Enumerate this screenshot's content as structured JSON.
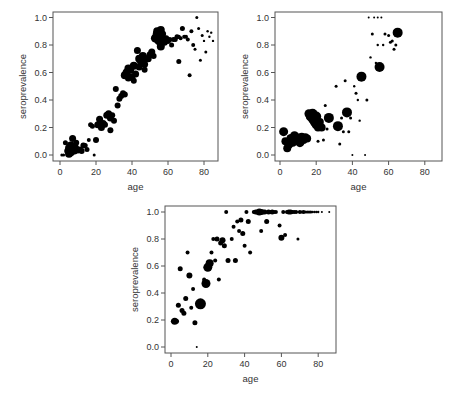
{
  "chart_data": [
    {
      "id": "chart1",
      "type": "scatter",
      "title": "",
      "xlabel": "age",
      "ylabel": "seroprevalence",
      "xlim": [
        -5,
        88
      ],
      "ylim": [
        -0.04,
        1.04
      ],
      "xticks": [
        0,
        20,
        40,
        60,
        80
      ],
      "yticks": [
        0.0,
        0.2,
        0.4,
        0.6,
        0.8,
        1.0
      ],
      "ytick_labels": [
        "0.0",
        "0.2",
        "0.4",
        "0.6",
        "0.8",
        "1.0"
      ],
      "grid": false,
      "legend": null,
      "frame": {
        "left": 53,
        "top": 12,
        "right": 218,
        "bottom": 161
      },
      "map": {
        "x0": 60,
        "xs": 1.8,
        "y0": 155,
        "ys": 137.5
      },
      "points": [
        [
          1,
          0.0,
          1.5
        ],
        [
          2,
          0.0,
          1.5
        ],
        [
          3,
          0.09,
          2.5
        ],
        [
          4,
          0.03,
          3
        ],
        [
          5,
          0.01,
          4
        ],
        [
          5,
          0.05,
          4
        ],
        [
          6,
          0.02,
          4
        ],
        [
          6,
          0.07,
          4
        ],
        [
          7,
          0.04,
          4
        ],
        [
          7,
          0.12,
          3.5
        ],
        [
          8,
          0.06,
          4
        ],
        [
          8,
          0.03,
          3.5
        ],
        [
          9,
          0.05,
          3
        ],
        [
          9,
          0.09,
          3
        ],
        [
          10,
          0.03,
          2.5
        ],
        [
          11,
          0.04,
          3
        ],
        [
          12,
          0.03,
          3
        ],
        [
          13,
          0.07,
          3
        ],
        [
          14,
          0.07,
          2.5
        ],
        [
          15,
          0.04,
          2.5
        ],
        [
          16,
          0.11,
          2
        ],
        [
          17,
          0.22,
          2.5
        ],
        [
          18,
          0.21,
          2.5
        ],
        [
          19,
          0.0,
          1.5
        ],
        [
          20,
          0.11,
          3
        ],
        [
          21,
          0.22,
          3.5
        ],
        [
          22,
          0.26,
          3.5
        ],
        [
          23,
          0.2,
          3.5
        ],
        [
          24,
          0.23,
          3.5
        ],
        [
          25,
          0.22,
          3
        ],
        [
          26,
          0.29,
          3.5
        ],
        [
          27,
          0.3,
          3.5
        ],
        [
          28,
          0.27,
          3.5
        ],
        [
          28,
          0.18,
          3
        ],
        [
          29,
          0.29,
          3
        ],
        [
          30,
          0.25,
          3
        ],
        [
          31,
          0.48,
          3
        ],
        [
          32,
          0.36,
          3
        ],
        [
          33,
          0.41,
          3
        ],
        [
          34,
          0.43,
          3
        ],
        [
          35,
          0.45,
          3
        ],
        [
          36,
          0.44,
          3
        ],
        [
          36,
          0.58,
          4
        ],
        [
          37,
          0.6,
          4
        ],
        [
          38,
          0.63,
          4
        ],
        [
          38,
          0.56,
          3.5
        ],
        [
          39,
          0.62,
          4
        ],
        [
          40,
          0.57,
          3.5
        ],
        [
          41,
          0.65,
          4
        ],
        [
          41,
          0.54,
          3
        ],
        [
          42,
          0.59,
          3.5
        ],
        [
          43,
          0.76,
          3.5
        ],
        [
          44,
          0.7,
          4
        ],
        [
          44,
          0.64,
          3.5
        ],
        [
          45,
          0.68,
          4
        ],
        [
          46,
          0.72,
          4
        ],
        [
          47,
          0.62,
          3
        ],
        [
          47,
          0.66,
          3.5
        ],
        [
          48,
          0.7,
          3.5
        ],
        [
          49,
          0.7,
          3.5
        ],
        [
          50,
          0.73,
          3.5
        ],
        [
          51,
          0.75,
          3.5
        ],
        [
          52,
          0.72,
          3
        ],
        [
          53,
          0.85,
          4.5
        ],
        [
          54,
          0.88,
          4.5
        ],
        [
          54,
          0.9,
          4
        ],
        [
          55,
          0.83,
          4.5
        ],
        [
          55,
          0.87,
          4.5
        ],
        [
          56,
          0.79,
          4
        ],
        [
          56,
          0.91,
          4
        ],
        [
          57,
          0.84,
          4
        ],
        [
          57,
          0.88,
          3.5
        ],
        [
          58,
          0.82,
          3.5
        ],
        [
          59,
          0.85,
          3
        ],
        [
          60,
          0.83,
          3
        ],
        [
          61,
          0.84,
          2.5
        ],
        [
          62,
          0.8,
          2.5
        ],
        [
          63,
          0.84,
          2.5
        ],
        [
          64,
          0.84,
          2.5
        ],
        [
          65,
          0.86,
          2.5
        ],
        [
          66,
          0.68,
          2.5
        ],
        [
          66,
          0.86,
          2
        ],
        [
          67,
          0.85,
          2
        ],
        [
          68,
          0.92,
          2.5
        ],
        [
          69,
          0.86,
          2
        ],
        [
          70,
          0.86,
          2
        ],
        [
          71,
          0.84,
          2
        ],
        [
          72,
          0.58,
          2
        ],
        [
          73,
          0.9,
          2
        ],
        [
          74,
          0.8,
          2
        ],
        [
          75,
          0.77,
          1.5
        ],
        [
          76,
          1.0,
          1.5
        ],
        [
          77,
          0.92,
          1.5
        ],
        [
          78,
          0.69,
          1.5
        ],
        [
          79,
          0.87,
          1.5
        ],
        [
          80,
          0.83,
          1.2
        ],
        [
          81,
          0.75,
          1.5
        ],
        [
          82,
          0.9,
          1.2
        ],
        [
          83,
          0.86,
          1.2
        ],
        [
          84,
          0.89,
          1.2
        ],
        [
          85,
          0.83,
          1.2
        ]
      ]
    },
    {
      "id": "chart2",
      "type": "scatter",
      "title": "",
      "xlabel": "age",
      "ylabel": "seroprevalence",
      "xlim": [
        -3,
        89
      ],
      "ylim": [
        -0.04,
        1.04
      ],
      "xticks": [
        0,
        20,
        40,
        60,
        80
      ],
      "yticks": [
        0.0,
        0.2,
        0.4,
        0.6,
        0.8,
        1.0
      ],
      "ytick_labels": [
        "0.0",
        "0.2",
        "0.4",
        "0.6",
        "0.8",
        "1.0"
      ],
      "grid": false,
      "legend": null,
      "frame": {
        "left": 275,
        "top": 12,
        "right": 442,
        "bottom": 161
      },
      "map": {
        "x0": 280,
        "xs": 1.81,
        "y0": 155,
        "ys": 137.5
      },
      "points": [
        [
          2,
          0.17,
          4.5
        ],
        [
          3,
          0.1,
          4
        ],
        [
          4,
          0.05,
          4
        ],
        [
          5,
          0.08,
          4.5
        ],
        [
          6,
          0.12,
          4.5
        ],
        [
          7,
          0.09,
          4
        ],
        [
          8,
          0.14,
          4.5
        ],
        [
          9,
          0.11,
          4.5
        ],
        [
          10,
          0.12,
          5
        ],
        [
          11,
          0.09,
          4.5
        ],
        [
          12,
          0.13,
          4.5
        ],
        [
          13,
          0.11,
          4
        ],
        [
          14,
          0.13,
          4
        ],
        [
          15,
          0.12,
          4
        ],
        [
          16,
          0.3,
          4.5
        ],
        [
          17,
          0.28,
          5
        ],
        [
          18,
          0.3,
          5
        ],
        [
          18,
          0.26,
          4.5
        ],
        [
          19,
          0.24,
          4.5
        ],
        [
          20,
          0.28,
          5
        ],
        [
          20,
          0.22,
          4.5
        ],
        [
          21,
          0.2,
          4
        ],
        [
          22,
          0.24,
          4
        ],
        [
          23,
          0.2,
          4
        ],
        [
          21,
          0.1,
          1.5
        ],
        [
          24,
          0.11,
          1.5
        ],
        [
          25,
          0.36,
          1.5
        ],
        [
          26,
          0.19,
          1.5
        ],
        [
          27,
          0.27,
          5
        ],
        [
          31,
          0.5,
          1.5
        ],
        [
          32,
          0.21,
          5
        ],
        [
          33,
          0.08,
          1.5
        ],
        [
          34,
          0.27,
          1.5
        ],
        [
          35,
          0.17,
          1.5
        ],
        [
          36,
          0.54,
          1.5
        ],
        [
          37,
          0.31,
          5
        ],
        [
          38,
          0.17,
          1.5
        ],
        [
          39,
          0.27,
          1.5
        ],
        [
          40,
          0.0,
          1
        ],
        [
          41,
          0.5,
          1.2
        ],
        [
          42,
          0.45,
          1.5
        ],
        [
          43,
          0.4,
          1.2
        ],
        [
          44,
          0.25,
          1.2
        ],
        [
          45,
          0.57,
          5
        ],
        [
          47,
          0.0,
          1
        ],
        [
          48,
          0.4,
          1.5
        ],
        [
          49,
          1.0,
          1
        ],
        [
          50,
          0.71,
          1.2
        ],
        [
          51,
          0.88,
          1.5
        ],
        [
          52,
          1.0,
          1
        ],
        [
          53,
          0.67,
          1.2
        ],
        [
          54,
          1.0,
          1
        ],
        [
          54,
          0.8,
          1.2
        ],
        [
          55,
          0.64,
          5
        ],
        [
          56,
          1.0,
          1
        ],
        [
          57,
          0.8,
          1.2
        ],
        [
          58,
          0.88,
          1.5
        ],
        [
          60,
          0.87,
          1.5
        ],
        [
          61,
          0.82,
          1.5
        ],
        [
          62,
          0.83,
          1.5
        ],
        [
          63,
          0.77,
          1.5
        ],
        [
          64,
          0.8,
          1.5
        ],
        [
          65,
          0.89,
          5
        ]
      ]
    },
    {
      "id": "chart3",
      "type": "scatter",
      "title": "",
      "xlabel": "age",
      "ylabel": "seroprevalence",
      "xlim": [
        -3,
        90
      ],
      "ylim": [
        -0.04,
        1.04
      ],
      "xticks": [
        0,
        20,
        40,
        60,
        80
      ],
      "yticks": [
        0.0,
        0.2,
        0.4,
        0.6,
        0.8,
        1.0
      ],
      "ytick_labels": [
        "0.0",
        "0.2",
        "0.4",
        "0.6",
        "0.8",
        "1.0"
      ],
      "grid": false,
      "legend": null,
      "frame": {
        "left": 165,
        "top": 206,
        "right": 336,
        "bottom": 353
      },
      "map": {
        "x0": 171,
        "xs": 1.84,
        "y0": 347,
        "ys": 135
      },
      "points": [
        [
          1,
          0.19,
          2
        ],
        [
          2,
          0.19,
          3.5
        ],
        [
          3,
          0.19,
          2.5
        ],
        [
          4,
          0.31,
          2.5
        ],
        [
          5,
          0.58,
          2.5
        ],
        [
          6,
          0.27,
          2.5
        ],
        [
          7,
          0.25,
          2.5
        ],
        [
          8,
          0.36,
          2.5
        ],
        [
          9,
          0.7,
          2
        ],
        [
          10,
          0.53,
          3
        ],
        [
          11,
          0.29,
          2
        ],
        [
          12,
          0.43,
          2
        ],
        [
          13,
          0.18,
          2.5
        ],
        [
          14,
          0.0,
          1
        ],
        [
          16,
          0.32,
          5.5
        ],
        [
          18,
          0.5,
          2
        ],
        [
          19,
          0.47,
          4.5
        ],
        [
          20,
          0.59,
          4.5
        ],
        [
          21,
          0.62,
          4
        ],
        [
          22,
          0.7,
          2
        ],
        [
          23,
          0.8,
          2
        ],
        [
          24,
          0.64,
          2
        ],
        [
          25,
          0.8,
          2.5
        ],
        [
          26,
          0.5,
          2
        ],
        [
          27,
          0.77,
          2.5
        ],
        [
          28,
          0.79,
          3
        ],
        [
          29,
          0.75,
          2.5
        ],
        [
          30,
          1.0,
          2
        ],
        [
          31,
          0.64,
          2.5
        ],
        [
          33,
          0.8,
          2
        ],
        [
          34,
          0.89,
          2
        ],
        [
          35,
          0.64,
          2.5
        ],
        [
          36,
          0.93,
          2
        ],
        [
          37,
          0.86,
          2
        ],
        [
          38,
          0.94,
          2.5
        ],
        [
          39,
          0.84,
          2.5
        ],
        [
          40,
          0.75,
          2
        ],
        [
          41,
          1.0,
          2
        ],
        [
          42,
          0.93,
          2.5
        ],
        [
          43,
          0.7,
          2
        ],
        [
          45,
          1.0,
          2
        ],
        [
          46,
          1.0,
          2.5
        ],
        [
          47,
          1.0,
          2.5
        ],
        [
          48,
          1.0,
          3.5
        ],
        [
          49,
          1.0,
          3
        ],
        [
          49,
          0.86,
          2
        ],
        [
          50,
          1.0,
          2.5
        ],
        [
          51,
          1.0,
          2.5
        ],
        [
          52,
          0.93,
          2.5
        ],
        [
          53,
          1.0,
          2.5
        ],
        [
          54,
          1.0,
          2
        ],
        [
          55,
          1.0,
          2.5
        ],
        [
          56,
          1.0,
          2
        ],
        [
          57,
          1.0,
          2
        ],
        [
          59,
          0.9,
          2
        ],
        [
          60,
          0.81,
          3
        ],
        [
          61,
          1.0,
          2
        ],
        [
          62,
          0.83,
          2
        ],
        [
          63,
          1.0,
          2
        ],
        [
          64,
          1.0,
          2.5
        ],
        [
          65,
          1.0,
          2.5
        ],
        [
          66,
          1.0,
          2
        ],
        [
          67,
          1.0,
          2
        ],
        [
          68,
          1.0,
          2
        ],
        [
          69,
          0.8,
          1.5
        ],
        [
          70,
          1.0,
          2
        ],
        [
          71,
          1.0,
          1.5
        ],
        [
          72,
          1.0,
          2
        ],
        [
          73,
          1.0,
          1.5
        ],
        [
          74,
          1.0,
          1.5
        ],
        [
          75,
          1.0,
          1.5
        ],
        [
          76,
          1.0,
          1.5
        ],
        [
          77,
          1.0,
          1.2
        ],
        [
          78,
          1.0,
          1.2
        ],
        [
          79,
          1.0,
          1.2
        ],
        [
          80,
          1.0,
          1.2
        ],
        [
          82,
          1.0,
          1
        ],
        [
          86,
          1.0,
          1
        ]
      ]
    }
  ]
}
